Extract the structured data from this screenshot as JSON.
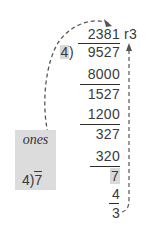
{
  "division": {
    "quotient": "2381",
    "remainder_label": "r3",
    "divisor": "4",
    "divisor_bracket": ")",
    "dividend": "9527",
    "steps": [
      {
        "subtract": "8000",
        "result": "1527"
      },
      {
        "subtract": "1200",
        "result": "327"
      },
      {
        "subtract": "320",
        "result": "7"
      },
      {
        "subtract": "4",
        "result": "3"
      }
    ],
    "trailing_dash": "-"
  },
  "side_box": {
    "label": "ones",
    "divisor": "4",
    "bracket": ")",
    "dividend": "7"
  },
  "colors": {
    "text": "#3a3a3a",
    "highlight": "#d9d9d9",
    "dashed_arrow": "#555555"
  }
}
